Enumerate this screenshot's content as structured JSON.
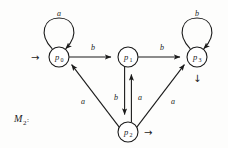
{
  "figure": {
    "name_main": "M",
    "name_sub": "2",
    "name_colon": ":",
    "type": "finite-state-automaton-diagram"
  },
  "states": [
    {
      "id": "p0",
      "label_main": "p",
      "label_sub": "0",
      "cx": 59,
      "cy": 57,
      "r": 10
    },
    {
      "id": "p1",
      "label_main": "p",
      "label_sub": "1",
      "cx": 128,
      "cy": 57,
      "r": 10
    },
    {
      "id": "p3",
      "label_main": "p",
      "label_sub": "3",
      "cx": 197,
      "cy": 57,
      "r": 10
    },
    {
      "id": "p2",
      "label_main": "p",
      "label_sub": "2",
      "cx": 128,
      "cy": 132,
      "r": 10
    }
  ],
  "self_loops": [
    {
      "id": "loop-p0",
      "on": "p0",
      "symbol": "a",
      "label_x": 59,
      "label_y": 16
    },
    {
      "id": "loop-p3",
      "on": "p3",
      "symbol": "b",
      "label_x": 197,
      "label_y": 16
    }
  ],
  "transitions": [
    {
      "id": "p0-to-p1",
      "from": "p0",
      "to": "p1",
      "symbol": "b",
      "label_x": 93,
      "label_y": 47
    },
    {
      "id": "p1-to-p3",
      "from": "p1",
      "to": "p3",
      "symbol": "b",
      "label_x": 162,
      "label_y": 47
    },
    {
      "id": "p1-to-p2",
      "from": "p1",
      "to": "p2",
      "symbol": "b",
      "label_x": 116,
      "label_y": 97
    },
    {
      "id": "p2-to-p1",
      "from": "p2",
      "to": "p1",
      "symbol": "a",
      "label_x": 139,
      "label_y": 97
    },
    {
      "id": "p2-to-p0",
      "from": "p2",
      "to": "p0",
      "symbol": "a",
      "label_x": 83,
      "label_y": 101
    },
    {
      "id": "p2-to-p3",
      "from": "p2",
      "to": "p3",
      "symbol": "a",
      "label_x": 172,
      "label_y": 101
    }
  ],
  "markers": [
    {
      "id": "start-arrow",
      "glyph": "→",
      "x": 31,
      "y": 61,
      "target": "p0",
      "meaning": "start-state-indicator"
    },
    {
      "id": "p3-arrow-down",
      "glyph": "↓",
      "x": 193,
      "y": 82,
      "target": "p3",
      "meaning": "state-marker"
    },
    {
      "id": "p2-arrow-right",
      "glyph": "→",
      "x": 144,
      "y": 136,
      "target": "p2",
      "meaning": "state-marker"
    }
  ],
  "colors": {
    "ink": "#1a1a1a",
    "paper": "#fdfdfc"
  }
}
